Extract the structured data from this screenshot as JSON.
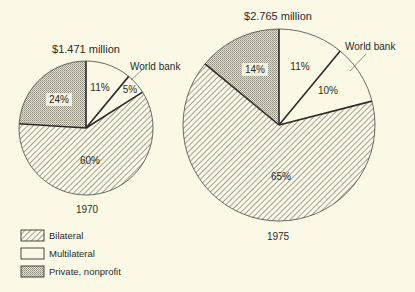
{
  "chart_data": [
    {
      "type": "pie",
      "title": "$1.471 million",
      "caption": "1970",
      "categories": [
        "Multilateral",
        "World bank",
        "Bilateral",
        "Private, nonprofit"
      ],
      "values": [
        11,
        5,
        60,
        24
      ],
      "labels": [
        "11%",
        "5%",
        "60%",
        "24%"
      ],
      "callout": "World bank"
    },
    {
      "type": "pie",
      "title": "$2.765 million",
      "caption": "1975",
      "categories": [
        "Multilateral",
        "World bank",
        "Bilateral",
        "Private, nonprofit"
      ],
      "values": [
        11,
        10,
        65,
        14
      ],
      "labels": [
        "11%",
        "10%",
        "65%",
        "14%"
      ],
      "callout": "World bank"
    }
  ],
  "legend": [
    {
      "label": "Bilateral",
      "pattern": "hatch"
    },
    {
      "label": "Multilateral",
      "pattern": "blank"
    },
    {
      "label": "Private, nonprofit",
      "pattern": "stipple"
    }
  ],
  "colors": {
    "background": "#fbf9e6",
    "ink": "#2a2a2a",
    "stipple": "#c9c6b4"
  }
}
